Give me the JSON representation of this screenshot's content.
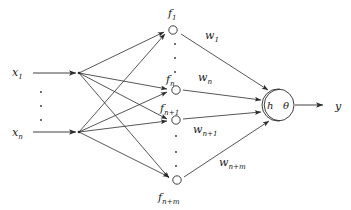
{
  "diagram": {
    "colors": {
      "stroke": "#2b2b2b",
      "text": "#1a1a1a",
      "background": "#ffffff",
      "node_fill": "#ffffff"
    },
    "inputs": [
      {
        "id": "x1",
        "base": "x",
        "sub": "1",
        "x": 18,
        "y": 75
      },
      {
        "id": "xn",
        "base": "x",
        "sub": "n",
        "x": 18,
        "y": 135
      }
    ],
    "input_ellipsis": {
      "count": 3,
      "x": 41,
      "ys": [
        92,
        106,
        120
      ]
    },
    "hidden_nodes": [
      {
        "id": "f1",
        "base": "f",
        "sub": "1",
        "label_x": 172,
        "label_y": 16,
        "cx": 173,
        "cy": 30
      },
      {
        "id": "fn",
        "base": "f",
        "sub": "n",
        "label_x": 169,
        "label_y": 82,
        "cx": 176,
        "cy": 90
      },
      {
        "id": "fn1",
        "base": "f",
        "sub": "n+1",
        "label_x": 163,
        "label_y": 110,
        "cx": 176,
        "cy": 120
      },
      {
        "id": "fnm",
        "base": "f",
        "sub": "n+m",
        "label_x": 162,
        "label_y": 200,
        "cx": 177,
        "cy": 180
      }
    ],
    "hidden_ellipsis_upper": {
      "count": 3,
      "x": 175,
      "ys": [
        44,
        58,
        72
      ]
    },
    "hidden_ellipsis_lower": {
      "count": 3,
      "x": 176,
      "ys": [
        136,
        152,
        166
      ]
    },
    "weights": [
      {
        "id": "w1",
        "base": "w",
        "sub": "1",
        "x": 208,
        "y": 38
      },
      {
        "id": "wn",
        "base": "w",
        "sub": "n",
        "x": 200,
        "y": 80
      },
      {
        "id": "wn1",
        "base": "w",
        "sub": "n+1",
        "x": 196,
        "y": 131
      },
      {
        "id": "wnm",
        "base": "w",
        "sub": "n+m",
        "x": 223,
        "y": 165
      }
    ],
    "neuron": {
      "cx": 278,
      "cy": 105,
      "r": 16,
      "h_label": "h",
      "h_x": 270,
      "h_y": 109,
      "theta_label": "θ",
      "theta_x": 286,
      "theta_y": 109
    },
    "output": {
      "id": "y",
      "label": "y",
      "x": 338,
      "y": 110,
      "arrow_from_x": 295,
      "arrow_to_x": 326,
      "arrow_y": 105
    },
    "fan_points": [
      {
        "id": "fan-top",
        "x": 79,
        "y": 73
      },
      {
        "id": "fan-bottom",
        "x": 79,
        "y": 132
      }
    ]
  }
}
